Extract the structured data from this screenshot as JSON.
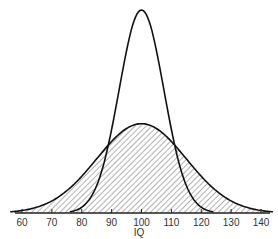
{
  "chart_data": {
    "type": "line",
    "title": "",
    "xlabel": "IQ",
    "ylabel": "",
    "xlim": [
      58,
      142
    ],
    "x_ticks": [
      60,
      70,
      80,
      90,
      100,
      110,
      120,
      130,
      140
    ],
    "grid": false,
    "legend": null,
    "series": [
      {
        "name": "narrow distribution",
        "mean": 100,
        "sd": 7.5,
        "shaded": false,
        "relative_peak_height": 1.0
      },
      {
        "name": "wide distribution",
        "mean": 100,
        "sd": 15,
        "shaded": true,
        "relative_peak_height": 0.44
      }
    ]
  },
  "colors": {
    "curve": "#111111",
    "hatch": "#555555",
    "axis": "#222222",
    "background": "#ffffff"
  }
}
